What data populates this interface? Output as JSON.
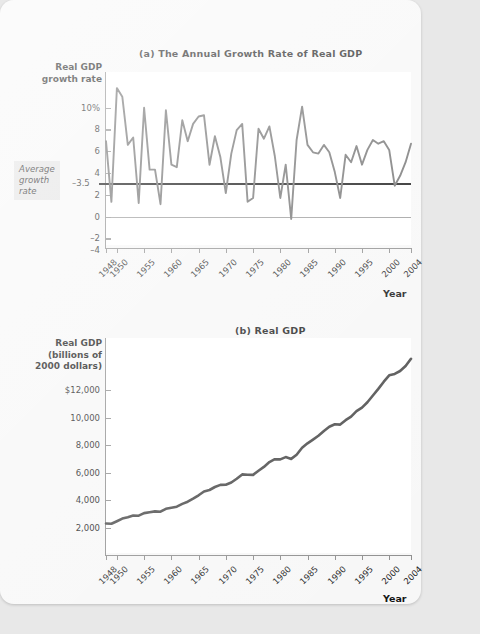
{
  "page": {
    "year_axis_label": "Year"
  },
  "chart_a": {
    "title": "(a) The Annual Growth Rate of Real GDP",
    "y_axis_title": "Real GDP\ngrowth rate",
    "y_axis_title_lines": [
      "Real GDP",
      "growth rate"
    ],
    "y_ticks": [
      "10%",
      "8",
      "6",
      "4",
      "2",
      "0",
      "–2",
      "–4"
    ],
    "y_tick_values": [
      10,
      8,
      6,
      4,
      2,
      0,
      -2,
      -4
    ],
    "average_label_lines": [
      "Average",
      "growth",
      "rate"
    ],
    "average_value_label": "–3.5",
    "average_value": 3.5,
    "x_ticks": [
      "1948",
      "1950",
      "1955",
      "1960",
      "1965",
      "1970",
      "1975",
      "1980",
      "1985",
      "1990",
      "1995",
      "2000",
      "2004"
    ]
  },
  "chart_b": {
    "title": "(b) Real GDP",
    "y_axis_title_lines": [
      "Real GDP",
      "(billions of",
      "2000 dollars)"
    ],
    "y_ticks": [
      "$12,000",
      "10,000",
      "8,000",
      "6,000",
      "4,000",
      "2,000"
    ],
    "y_tick_values": [
      12000,
      10000,
      8000,
      6000,
      4000,
      2000
    ],
    "x_ticks": [
      "1948",
      "1950",
      "1955",
      "1960",
      "1965",
      "1970",
      "1975",
      "1980",
      "1985",
      "1990",
      "1995",
      "2000",
      "2004"
    ]
  },
  "colors": {
    "series_line": "#6e6e6e",
    "gdp_line": "#4a4a4a",
    "average_line": "#111111",
    "axis": "#8d8d8d",
    "plot_bg": "#ffffff",
    "page_bg": "#f7f7f7",
    "callout_bg": "#e3e3e3"
  },
  "chart_data": [
    {
      "type": "line",
      "id": "annual-growth-rate",
      "title": "(a) The Annual Growth Rate of Real GDP",
      "xlabel": "Year",
      "ylabel": "Real GDP growth rate",
      "ylim": [
        -4,
        10
      ],
      "xlim": [
        1948,
        2004
      ],
      "grid": false,
      "legend": "none",
      "annotations": [
        {
          "label": "Average growth rate",
          "value": 3.5,
          "type": "hline",
          "style": "bold-black"
        }
      ],
      "x": [
        1948,
        1949,
        1950,
        1951,
        1952,
        1953,
        1954,
        1955,
        1956,
        1957,
        1958,
        1959,
        1960,
        1961,
        1962,
        1963,
        1964,
        1965,
        1966,
        1967,
        1968,
        1969,
        1970,
        1971,
        1972,
        1973,
        1974,
        1975,
        1976,
        1977,
        1978,
        1979,
        1980,
        1981,
        1982,
        1983,
        1984,
        1985,
        1986,
        1987,
        1988,
        1989,
        1990,
        1991,
        1992,
        1993,
        1994,
        1995,
        1996,
        1997,
        1998,
        1999,
        2000,
        2001,
        2002,
        2003,
        2004
      ],
      "values": [
        4.4,
        -0.5,
        8.7,
        8.0,
        4.1,
        4.7,
        -0.6,
        7.1,
        2.1,
        2.1,
        -0.7,
        6.9,
        2.5,
        2.3,
        6.1,
        4.4,
        5.8,
        6.4,
        6.5,
        2.5,
        4.8,
        3.1,
        0.2,
        3.4,
        5.3,
        5.8,
        -0.5,
        -0.2,
        5.4,
        4.6,
        5.6,
        3.2,
        -0.2,
        2.5,
        -1.9,
        4.5,
        7.2,
        4.1,
        3.5,
        3.4,
        4.1,
        3.5,
        1.9,
        -0.2,
        3.3,
        2.7,
        4.0,
        2.5,
        3.7,
        4.5,
        4.2,
        4.4,
        3.7,
        0.8,
        1.6,
        2.7,
        4.2
      ],
      "series_color": "#6e6e6e"
    },
    {
      "type": "line",
      "id": "real-gdp",
      "title": "(b) Real GDP",
      "xlabel": "Year",
      "ylabel": "Real GDP (billions of 2000 dollars)",
      "ylim": [
        0,
        12000
      ],
      "xlim": [
        1948,
        2004
      ],
      "grid": false,
      "legend": "none",
      "x": [
        1948,
        1949,
        1950,
        1951,
        1952,
        1953,
        1954,
        1955,
        1956,
        1957,
        1958,
        1959,
        1960,
        1961,
        1962,
        1963,
        1964,
        1965,
        1966,
        1967,
        1968,
        1969,
        1970,
        1971,
        1972,
        1973,
        1974,
        1975,
        1976,
        1977,
        1978,
        1979,
        1980,
        1981,
        1982,
        1983,
        1984,
        1985,
        1986,
        1987,
        1988,
        1989,
        1990,
        1991,
        1992,
        1993,
        1994,
        1995,
        1996,
        1997,
        1998,
        1999,
        2000,
        2001,
        2002,
        2003,
        2004
      ],
      "values": [
        1644,
        1635,
        1777,
        1919,
        1999,
        2093,
        2080,
        2228,
        2275,
        2323,
        2306,
        2465,
        2527,
        2586,
        2743,
        2863,
        3029,
        3223,
        3433,
        3518,
        3686,
        3801,
        3810,
        3937,
        4146,
        4387,
        4366,
        4357,
        4592,
        4804,
        5073,
        5234,
        5222,
        5353,
        5250,
        5485,
        5880,
        6120,
        6332,
        6544,
        6812,
        7050,
        7183,
        7167,
        7410,
        7613,
        7915,
        8113,
        8413,
        8792,
        9159,
        9563,
        9918,
        9996,
        10158,
        10435,
        10838
      ],
      "series_color": "#4a4a4a"
    }
  ]
}
